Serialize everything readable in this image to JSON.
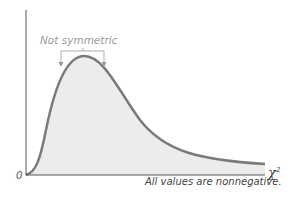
{
  "diagram": {
    "type": "chi-square distribution curve",
    "annotation": "Not symmetric",
    "origin_label": "0",
    "x_axis_label": "χ",
    "x_axis_superscript": "2",
    "footnote": "All values are nonnegative.",
    "colors": {
      "curve": "#7a7a7a",
      "fill": "#ececec",
      "axis": "#555555",
      "annotation": "#9a9a9a"
    }
  }
}
